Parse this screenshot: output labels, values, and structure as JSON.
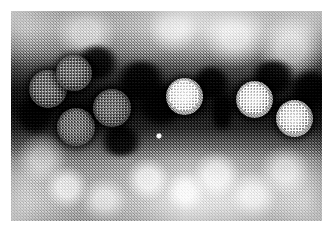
{
  "figure": {
    "kind": "transmission-electron-micrograph",
    "caption": "",
    "alt_text": "Negative-stain transmission electron micrograph showing a cluster of roughly spherical, icosahedral virus particles with granular capsomere-studded surfaces, embedded in a dark horizontal band of electron-dense stain against a pale mottled background.",
    "plate": {
      "x": 11,
      "y": 11,
      "width": 311,
      "height": 210,
      "paper_margin_color": "#ffffff",
      "background_light_tone": "#e6e6e6",
      "stain_band_color": "#1e1e1e",
      "particle_tone": "#b4b4b4"
    },
    "stain_band": {
      "name": "electron-dense-stain-band",
      "top_fraction": 0.22,
      "bottom_fraction": 0.68
    },
    "particles": [
      {
        "id": 1,
        "cx": 37,
        "cy": 78,
        "d": 38,
        "shade": "dim"
      },
      {
        "id": 2,
        "cx": 63,
        "cy": 62,
        "d": 36,
        "shade": "dim"
      },
      {
        "id": 3,
        "cx": 65,
        "cy": 116,
        "d": 38,
        "shade": "dim"
      },
      {
        "id": 4,
        "cx": 101,
        "cy": 97,
        "d": 38,
        "shade": "dim"
      },
      {
        "id": 5,
        "cx": 173,
        "cy": 85,
        "d": 37,
        "shade": "bright"
      },
      {
        "id": 6,
        "cx": 243,
        "cy": 88,
        "d": 37,
        "shade": "bright"
      },
      {
        "id": 7,
        "cx": 283,
        "cy": 107,
        "d": 37,
        "shade": "bright"
      }
    ],
    "stain_blobs": [
      {
        "cx": 86,
        "cy": 52,
        "w": 46,
        "h": 34
      },
      {
        "cx": 130,
        "cy": 70,
        "w": 54,
        "h": 40
      },
      {
        "cx": 150,
        "cy": 94,
        "w": 44,
        "h": 44
      },
      {
        "cx": 200,
        "cy": 72,
        "w": 40,
        "h": 34
      },
      {
        "cx": 211,
        "cy": 100,
        "w": 18,
        "h": 52
      },
      {
        "cx": 262,
        "cy": 66,
        "w": 50,
        "h": 32
      },
      {
        "cx": 300,
        "cy": 78,
        "w": 40,
        "h": 40
      },
      {
        "cx": 24,
        "cy": 104,
        "w": 36,
        "h": 40
      },
      {
        "cx": 110,
        "cy": 130,
        "w": 46,
        "h": 30
      }
    ],
    "bright_speck": {
      "cx": 148,
      "cy": 125,
      "d": 6,
      "color": "#ffffff"
    }
  }
}
